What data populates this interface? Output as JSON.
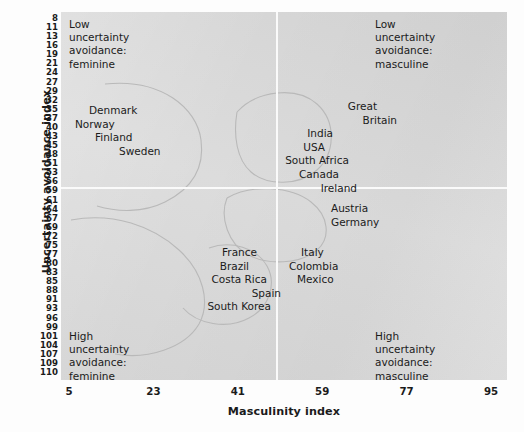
{
  "chart_data": {
    "type": "scatter",
    "title": "",
    "subtitle": "",
    "xlabel": "Masculinity index",
    "ylabel": "Uncertainty avoidance index",
    "xlim": [
      5,
      95
    ],
    "ylim": [
      8,
      110
    ],
    "grid": false,
    "legend_position": "none",
    "x_ticks": [
      5,
      23,
      41,
      59,
      77,
      95
    ],
    "x_tick_labels": [
      "5",
      "23",
      "41",
      "59",
      "77",
      "95"
    ],
    "y_tick_labels": [
      "8",
      "11",
      "13",
      "16",
      "19",
      "21",
      "24",
      "27",
      "29",
      "32",
      "35",
      "37",
      "40",
      "43",
      "45",
      "48",
      "51",
      "53",
      "56",
      "59",
      "61",
      "64",
      "67",
      "69",
      "72",
      "75",
      "77",
      "80",
      "83",
      "85",
      "88",
      "91",
      "93",
      "96",
      "99",
      "101",
      "104",
      "107",
      "109",
      "110"
    ],
    "quadrant_split": {
      "x": 50,
      "y": 56
    },
    "quadrant_notes": [
      {
        "id": "top-left",
        "text": "Low\nuncertainty\navoidance:\nfeminine"
      },
      {
        "id": "top-right",
        "text": "Low\nuncertainty\navoidance:\nmasculine"
      },
      {
        "id": "bottom-left",
        "text": "High\nuncertainty\navoidance:\nfeminine"
      },
      {
        "id": "bottom-right",
        "text": "High\nuncertainty\navoidance:\nmasculine"
      }
    ],
    "clusters": [
      {
        "id": "nordic",
        "quadrant": "top-left",
        "countries": [
          "Denmark",
          "Norway",
          "Finland",
          "Sweden"
        ]
      },
      {
        "id": "anglo",
        "quadrant": "top-right",
        "countries": [
          "Great",
          "Britain",
          "India",
          "USA",
          "South Africa",
          "Canada",
          "Ireland"
        ]
      },
      {
        "id": "latin-european",
        "quadrant": "bottom-left",
        "countries": [
          "France",
          "Brazil",
          "Costa Rica",
          "Spain",
          "South Korea"
        ]
      },
      {
        "id": "germanic",
        "quadrant": "bottom-right",
        "countries": [
          "Austria",
          "Germany"
        ]
      },
      {
        "id": "latin-american",
        "quadrant": "bottom-right",
        "countries": [
          "Italy",
          "Colombia",
          "Mexico"
        ]
      }
    ],
    "colors": {
      "plot_background": "#d8d8d8",
      "page_background": "#fdfdfd",
      "divider": "#fafafa",
      "text": "#1b1b1b",
      "cluster_outline": "#b9b9b9"
    }
  },
  "axes": {
    "y_title": "Uncertainty avoidance index",
    "x_title": "Masculinity index"
  }
}
